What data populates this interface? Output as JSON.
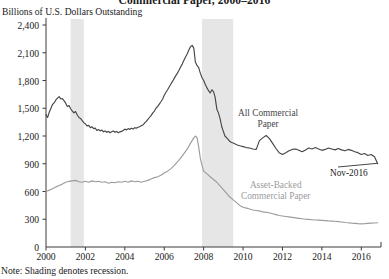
{
  "chart_data": {
    "type": "line",
    "title": "Commercial Paper, 2000–2016",
    "subtitle": "Billions of U.S. Dollars Outstanding",
    "ylabel": "Billions of U.S. Dollars Outstanding",
    "xlabel": "",
    "note": "Note: Shading denotes recession.",
    "grid": false,
    "legend_position": "inline-annotation",
    "xlim": [
      2000.0,
      2017.0
    ],
    "ylim": [
      0,
      2400
    ],
    "yticks": [
      300,
      600,
      900,
      1200,
      1500,
      1800,
      2100,
      2400
    ],
    "ytick_labels": [
      "300",
      "600",
      "900",
      "1,200",
      "1,500",
      "1,800",
      "2,100",
      "2,400"
    ],
    "y_origin_label": "0",
    "xticks": [
      2000,
      2002,
      2004,
      2006,
      2008,
      2010,
      2012,
      2014,
      2016
    ],
    "xtick_labels": [
      "2000",
      "2002",
      "2004",
      "2006",
      "2008",
      "2010",
      "2012",
      "2014",
      "2016"
    ],
    "shaded_regions": [
      {
        "label": "2001 recession",
        "x0": 2001.25,
        "x1": 2001.92,
        "color": "#e6e6e6"
      },
      {
        "label": "2007-2009 recession",
        "x0": 2007.92,
        "x1": 2009.5,
        "color": "#e6e6e6"
      }
    ],
    "annotations": [
      {
        "text": "Nov-2016",
        "x": 2016.3,
        "y": 870,
        "series": "All Commercial Paper"
      }
    ],
    "series": [
      {
        "name": "All Commercial Paper",
        "label_lines": [
          "All Commercial",
          "Paper"
        ],
        "color": "#46464a",
        "x": [
          2000.0,
          2000.08,
          2000.17,
          2000.25,
          2000.33,
          2000.42,
          2000.5,
          2000.58,
          2000.67,
          2000.75,
          2000.83,
          2000.92,
          2001.0,
          2001.08,
          2001.17,
          2001.25,
          2001.33,
          2001.42,
          2001.5,
          2001.58,
          2001.67,
          2001.75,
          2001.83,
          2001.92,
          2002.0,
          2002.08,
          2002.17,
          2002.25,
          2002.33,
          2002.42,
          2002.5,
          2002.58,
          2002.67,
          2002.75,
          2002.83,
          2002.92,
          2003.0,
          2003.08,
          2003.17,
          2003.25,
          2003.33,
          2003.42,
          2003.5,
          2003.58,
          2003.67,
          2003.75,
          2003.83,
          2003.92,
          2004.0,
          2004.08,
          2004.17,
          2004.25,
          2004.33,
          2004.42,
          2004.5,
          2004.58,
          2004.67,
          2004.75,
          2004.83,
          2004.92,
          2005.0,
          2005.08,
          2005.17,
          2005.25,
          2005.33,
          2005.42,
          2005.5,
          2005.58,
          2005.67,
          2005.75,
          2005.83,
          2005.92,
          2006.0,
          2006.08,
          2006.17,
          2006.25,
          2006.33,
          2006.42,
          2006.5,
          2006.58,
          2006.67,
          2006.75,
          2006.83,
          2006.92,
          2007.0,
          2007.08,
          2007.17,
          2007.25,
          2007.33,
          2007.42,
          2007.5,
          2007.58,
          2007.67,
          2007.75,
          2007.83,
          2007.92,
          2008.0,
          2008.08,
          2008.17,
          2008.25,
          2008.33,
          2008.42,
          2008.5,
          2008.58,
          2008.67,
          2008.75,
          2008.83,
          2008.92,
          2009.0,
          2009.08,
          2009.17,
          2009.25,
          2009.33,
          2009.42,
          2009.5,
          2009.58,
          2009.67,
          2009.75,
          2009.83,
          2009.92,
          2010.0,
          2010.17,
          2010.33,
          2010.5,
          2010.67,
          2010.83,
          2011.0,
          2011.17,
          2011.33,
          2011.5,
          2011.67,
          2011.83,
          2012.0,
          2012.17,
          2012.33,
          2012.5,
          2012.67,
          2012.83,
          2013.0,
          2013.17,
          2013.33,
          2013.5,
          2013.67,
          2013.83,
          2014.0,
          2014.17,
          2014.33,
          2014.5,
          2014.67,
          2014.83,
          2015.0,
          2015.17,
          2015.33,
          2015.5,
          2015.67,
          2015.83,
          2016.0,
          2016.17,
          2016.33,
          2016.5,
          2016.67,
          2016.83
        ],
        "y": [
          1430,
          1400,
          1460,
          1500,
          1540,
          1560,
          1590,
          1610,
          1625,
          1600,
          1605,
          1580,
          1555,
          1520,
          1530,
          1495,
          1470,
          1450,
          1465,
          1430,
          1400,
          1390,
          1370,
          1345,
          1330,
          1310,
          1315,
          1290,
          1300,
          1280,
          1285,
          1260,
          1270,
          1255,
          1265,
          1245,
          1255,
          1240,
          1250,
          1235,
          1245,
          1255,
          1240,
          1250,
          1235,
          1245,
          1250,
          1260,
          1275,
          1265,
          1280,
          1270,
          1285,
          1275,
          1290,
          1285,
          1295,
          1300,
          1310,
          1320,
          1340,
          1355,
          1380,
          1400,
          1420,
          1450,
          1470,
          1500,
          1520,
          1545,
          1570,
          1600,
          1640,
          1670,
          1700,
          1730,
          1760,
          1790,
          1820,
          1850,
          1880,
          1910,
          1945,
          1980,
          2020,
          2055,
          2090,
          2130,
          2165,
          2180,
          2150,
          2000,
          1960,
          1940,
          1880,
          1830,
          1800,
          1760,
          1720,
          1690,
          1665,
          1700,
          1680,
          1620,
          1490,
          1450,
          1390,
          1300,
          1250,
          1200,
          1180,
          1160,
          1140,
          1130,
          1125,
          1115,
          1105,
          1100,
          1095,
          1090,
          1085,
          1075,
          1070,
          1060,
          1055,
          1150,
          1180,
          1205,
          1175,
          1120,
          1065,
          1020,
          1000,
          1020,
          1040,
          1055,
          1060,
          1045,
          1030,
          1050,
          1070,
          1060,
          1075,
          1060,
          1045,
          1055,
          1070,
          1060,
          1050,
          1065,
          1050,
          1040,
          1055,
          1045,
          1030,
          1020,
          1000,
          1010,
          990,
          1000,
          975,
          900
        ]
      },
      {
        "name": "Asset-Backed Commercial Paper",
        "label_lines": [
          "Asset-Backed",
          "Commercial Paper"
        ],
        "color": "#9c9c9c",
        "x": [
          2000.0,
          2000.17,
          2000.33,
          2000.5,
          2000.67,
          2000.83,
          2001.0,
          2001.17,
          2001.33,
          2001.5,
          2001.67,
          2001.83,
          2002.0,
          2002.17,
          2002.33,
          2002.5,
          2002.67,
          2002.83,
          2003.0,
          2003.17,
          2003.33,
          2003.5,
          2003.67,
          2003.83,
          2004.0,
          2004.17,
          2004.33,
          2004.5,
          2004.67,
          2004.83,
          2005.0,
          2005.17,
          2005.33,
          2005.5,
          2005.67,
          2005.83,
          2006.0,
          2006.17,
          2006.33,
          2006.5,
          2006.67,
          2006.83,
          2007.0,
          2007.17,
          2007.33,
          2007.5,
          2007.58,
          2007.67,
          2007.75,
          2007.83,
          2007.92,
          2008.0,
          2008.17,
          2008.33,
          2008.5,
          2008.67,
          2008.83,
          2009.0,
          2009.17,
          2009.33,
          2009.5,
          2009.67,
          2009.83,
          2010.0,
          2010.17,
          2010.33,
          2010.5,
          2010.67,
          2010.83,
          2011.0,
          2011.17,
          2011.33,
          2011.5,
          2011.67,
          2011.83,
          2012.0,
          2012.17,
          2012.33,
          2012.5,
          2012.67,
          2012.83,
          2013.0,
          2013.17,
          2013.33,
          2013.5,
          2013.67,
          2013.83,
          2014.0,
          2014.17,
          2014.33,
          2014.5,
          2014.67,
          2014.83,
          2015.0,
          2015.17,
          2015.33,
          2015.5,
          2015.67,
          2015.83,
          2016.0,
          2016.17,
          2016.33,
          2016.5,
          2016.67,
          2016.83
        ],
        "y": [
          600,
          615,
          630,
          650,
          665,
          680,
          700,
          710,
          715,
          720,
          705,
          700,
          710,
          700,
          715,
          705,
          710,
          700,
          705,
          690,
          700,
          695,
          705,
          700,
          710,
          700,
          715,
          705,
          710,
          700,
          710,
          720,
          735,
          750,
          760,
          775,
          800,
          820,
          845,
          880,
          920,
          960,
          1010,
          1060,
          1120,
          1180,
          1200,
          1180,
          1080,
          960,
          880,
          820,
          790,
          760,
          730,
          700,
          660,
          620,
          580,
          540,
          510,
          480,
          450,
          430,
          420,
          410,
          400,
          395,
          390,
          380,
          375,
          370,
          360,
          350,
          340,
          335,
          330,
          325,
          320,
          315,
          310,
          305,
          300,
          298,
          295,
          292,
          290,
          288,
          285,
          282,
          280,
          278,
          275,
          270,
          265,
          262,
          258,
          255,
          252,
          250,
          252,
          255,
          258,
          260,
          262
        ]
      }
    ]
  }
}
